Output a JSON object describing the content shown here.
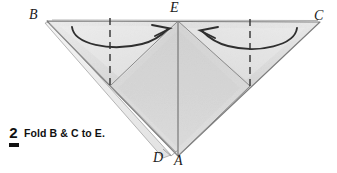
{
  "figure": {
    "kind": "origami-fold-diagram",
    "vertex_labels": {
      "B": "B",
      "C": "C",
      "E": "E",
      "D": "D",
      "A": "A"
    },
    "colors": {
      "paper_light": "#ebebeb",
      "paper_mid": "#dcdcdc",
      "paper_shadow": "#c9c9c9",
      "edge_line": "#7a7a7a",
      "fold_line": "#8a8a8a",
      "dashed_line": "#4a4a4a",
      "arrow": "#3a3a3a",
      "ink": "#111111",
      "background": "#ffffff"
    },
    "annotations": {
      "left_arrow": "curved-arrow-right-toward-E",
      "right_arrow": "curved-arrow-left-toward-E",
      "left_crease": "dashed-vertical-fold-line",
      "right_crease": "dashed-vertical-fold-line",
      "center_crease": "vertical-line-E-to-A"
    }
  },
  "caption": {
    "step_number": "2",
    "text": "Fold B & C to E."
  }
}
